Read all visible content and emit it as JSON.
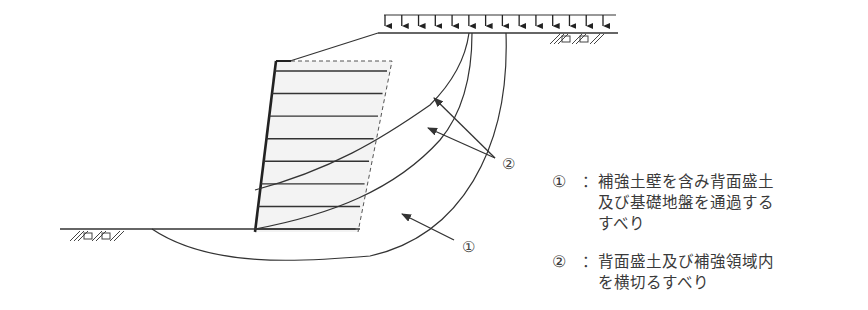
{
  "figure": {
    "labels": {
      "marker_1": "①",
      "marker_2": "②"
    },
    "legend": [
      {
        "marker": "①",
        "separator": "：",
        "lines": [
          "補強土壁を含み背面盛土",
          "及び基礎地盤を通過する",
          "すべり"
        ]
      },
      {
        "marker": "②",
        "separator": "：",
        "lines": [
          "背面盛土及び補強領域内",
          "を横切るすべり"
        ]
      }
    ],
    "load_arrow_count": 14,
    "reinforcement_layer_count": 8
  }
}
